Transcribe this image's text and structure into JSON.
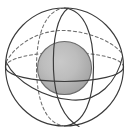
{
  "figure": {
    "name": "sphere-with-inner-core-diagram",
    "background_color": "#ffffff",
    "outline_color": "#3a3a3a",
    "hidden_line_color": "#6e6e6e",
    "core_fill_light": "#c2c2c2",
    "core_fill_dark": "#9a9a9a",
    "core_stroke": "#6b6b6b",
    "cut_text_top": "",
    "stroke_width": 1.15,
    "hidden_dash": "3,2.6"
  },
  "geometry": {
    "outer_sphere": {
      "label": "outer-sphere",
      "center_x": 64.5,
      "center_y": 67,
      "radius_x": 59,
      "radius_y": 59
    },
    "inner_sphere": {
      "label": "inner-core-sphere",
      "center_x": 64.5,
      "center_y": 68,
      "radius_x": 27,
      "radius_y": 26.5
    },
    "equator_front": {
      "label": "equator-ellipse-visible",
      "rx": 59,
      "ry": 15,
      "visible": true
    },
    "equator_back": {
      "label": "equator-ellipse-hidden",
      "rx": 59,
      "ry": 15,
      "visible": false
    },
    "tilted_ring": {
      "label": "tilted-great-circle-hidden",
      "rx": 59,
      "ry": 16,
      "rotation_deg": -14,
      "visible": false
    },
    "meridian_left": {
      "label": "meridian-left-visible",
      "rx": 27,
      "ry": 59
    },
    "meridian_right": {
      "label": "meridian-right-visible",
      "rx": 20,
      "ry": 59
    },
    "meridian_hidden": {
      "label": "meridian-hidden",
      "rx": 23,
      "ry": 59
    }
  },
  "legend": {
    "solid_line_meaning": "visible edge",
    "dashed_line_meaning": "hidden edge"
  }
}
